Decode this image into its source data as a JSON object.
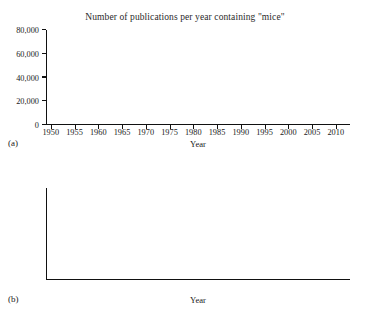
{
  "figure": {
    "panels": [
      {
        "tag": "(a)",
        "title": "Number of publications per year containing \"mice\"",
        "xlabel": "Year",
        "ylabel": ""
      },
      {
        "tag": "(b)",
        "title": "",
        "xlabel": "Year",
        "ylabel": ""
      }
    ]
  },
  "chart_data": [
    {
      "type": "scatter",
      "panel": "(a)",
      "title": "Number of publications per year containing \"mice\"",
      "xlabel": "Year",
      "ylabel": "",
      "xlim": [
        1949,
        2013
      ],
      "ylim": [
        0,
        80000
      ],
      "xticks": [
        1950,
        1955,
        1960,
        1965,
        1970,
        1975,
        1980,
        1985,
        1990,
        1995,
        2000,
        2005,
        2010
      ],
      "xticklabels": [
        "1950",
        "1955",
        "1960",
        "1965",
        "1970",
        "1975",
        "1980",
        "1985",
        "1990",
        "1995",
        "2000",
        "2005",
        "2010"
      ],
      "yticks": [
        0,
        20000,
        40000,
        60000,
        80000
      ],
      "yticklabels": [
        "0",
        "20,000",
        "40,000",
        "60,000",
        "80,000"
      ],
      "grid": false,
      "legend": null,
      "x": [
        1950,
        1951,
        1952,
        1953,
        1954,
        1955,
        1956,
        1957,
        1958,
        1959,
        1960,
        1961,
        1962,
        1963,
        1964,
        1965,
        1966,
        1967,
        1968,
        1969,
        1970,
        1971,
        1972,
        1973,
        1974,
        1975,
        1976,
        1977,
        1978,
        1979,
        1980,
        1981,
        1982,
        1983,
        1984,
        1985,
        1986,
        1987,
        1988,
        1989,
        1990,
        1991,
        1992,
        1993,
        1994,
        1995,
        1996,
        1997,
        1998,
        1999,
        2000,
        2001,
        2002,
        2003,
        2004,
        2005,
        2006,
        2007,
        2008,
        2009,
        2010,
        2011,
        2012
      ],
      "y": [
        300,
        350,
        400,
        450,
        500,
        550,
        600,
        650,
        700,
        750,
        800,
        900,
        1000,
        1300,
        4200,
        4800,
        5600,
        6200,
        6900,
        7600,
        8400,
        9200,
        9900,
        10400,
        10900,
        11200,
        11000,
        10600,
        10900,
        13500,
        14500,
        15300,
        15800,
        16400,
        17000,
        17600,
        17900,
        17600,
        18300,
        19100,
        20000,
        21000,
        22000,
        23000,
        24200,
        25400,
        26500,
        27400,
        28300,
        29500,
        31000,
        32800,
        34700,
        36800,
        39200,
        42000,
        45000,
        48500,
        52500,
        55000,
        57500,
        61000,
        64500
      ]
    },
    {
      "type": "scatter",
      "panel": "(b)",
      "title": "",
      "xlabel": "Year",
      "ylabel": "",
      "xlim": [
        1949,
        2013
      ],
      "ylim": [
        0,
        150
      ],
      "xticks": [
        1950,
        1955,
        1960,
        1965,
        1970,
        1975,
        1980,
        1985,
        1990,
        1995,
        2000,
        2005,
        2010
      ],
      "xticklabels": [
        "1950",
        "1955",
        "1960",
        "1965",
        "1970",
        "1975",
        "1980",
        "1985",
        "1990",
        "1995",
        "2000",
        "2005",
        "2010"
      ],
      "yticks": [
        0,
        50,
        100,
        150
      ],
      "yticklabels": [
        "0",
        "50",
        "100",
        "150"
      ],
      "grid": false,
      "legend": null,
      "x": [
        1959,
        1960,
        1961,
        1962,
        1963,
        1964,
        1965,
        1966,
        1967,
        1968,
        1969,
        1970,
        1971,
        1972,
        1973,
        1974,
        1975,
        1977,
        1978,
        1979,
        1980,
        1981,
        1982,
        1983,
        1984,
        1985,
        1986,
        1987,
        1988,
        1989,
        1990,
        1991,
        1992,
        1993,
        1994,
        1995,
        1996,
        1997,
        1998,
        1999,
        2000,
        2001,
        2002,
        2003,
        2004,
        2005,
        2006,
        2007,
        2008,
        2009,
        2010,
        2011,
        2012
      ],
      "y": [
        1,
        2,
        2,
        6,
        17,
        33,
        32,
        42,
        48,
        59,
        60,
        74,
        86,
        109,
        95,
        88,
        72,
        52,
        71,
        70,
        67,
        51,
        52,
        61,
        54,
        86,
        43,
        58,
        51,
        38,
        54,
        64,
        65,
        45,
        31,
        53,
        47,
        56,
        46,
        61,
        66,
        65,
        54,
        52,
        56,
        55,
        50,
        63,
        84,
        81,
        95,
        120,
        135
      ]
    }
  ]
}
